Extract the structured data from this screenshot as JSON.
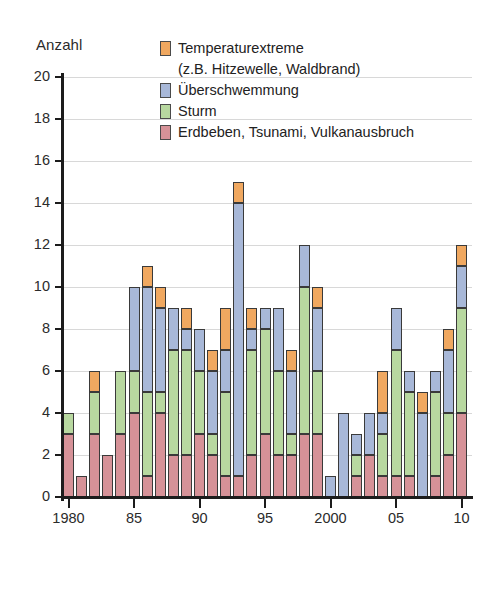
{
  "axis_title": "Anzahl",
  "legend": {
    "items": [
      {
        "label": "Temperaturextreme",
        "color": "#f0a860",
        "swatch": true
      },
      {
        "label": "(z.B. Hitzewelle, Waldbrand)",
        "color": "",
        "swatch": false
      },
      {
        "label": "Überschwemmung",
        "color": "#a8b8d8",
        "swatch": true
      },
      {
        "label": "Sturm",
        "color": "#b8d8a0",
        "swatch": true
      },
      {
        "label": "Erdbeben, Tsunami, Vulkanausbruch",
        "color": "#d69298",
        "swatch": true
      }
    ]
  },
  "caption": {
    "badge": "M 5",
    "text": "Große Naturkatastrophen",
    "accent_color": "#67c4cd"
  },
  "chart_data": {
    "type": "bar",
    "subtype": "stacked",
    "title": "Große Naturkatastrophen",
    "xlabel": "",
    "ylabel": "Anzahl",
    "ylim": [
      0,
      20
    ],
    "ytick_step": 2,
    "yticks": [
      0,
      2,
      4,
      6,
      8,
      10,
      12,
      14,
      16,
      18,
      20
    ],
    "grid": true,
    "grid_axis": "y",
    "legend_position": "top-right",
    "x": [
      1980,
      1981,
      1982,
      1983,
      1984,
      1985,
      1986,
      1987,
      1988,
      1989,
      1990,
      1991,
      1992,
      1993,
      1994,
      1995,
      1996,
      1997,
      1998,
      1999,
      2000,
      2001,
      2002,
      2003,
      2004,
      2005,
      2006,
      2007,
      2008,
      2009,
      2010
    ],
    "xtick_labels": [
      "1980",
      "85",
      "90",
      "95",
      "2000",
      "05",
      "10"
    ],
    "xtick_values": [
      1980,
      1985,
      1990,
      1995,
      2000,
      2005,
      2010
    ],
    "series": [
      {
        "name": "Erdbeben, Tsunami, Vulkanausbruch",
        "color": "#d69298",
        "values": [
          3,
          1,
          3,
          2,
          3,
          4,
          1,
          4,
          2,
          2,
          3,
          2,
          1,
          1,
          2,
          3,
          2,
          2,
          3,
          3,
          0,
          0,
          1,
          2,
          1,
          1,
          1,
          0,
          1,
          2,
          4
        ]
      },
      {
        "name": "Sturm",
        "color": "#b8d8a0",
        "values": [
          1,
          0,
          2,
          0,
          3,
          2,
          4,
          1,
          5,
          5,
          3,
          1,
          4,
          0,
          5,
          5,
          4,
          1,
          7,
          3,
          0,
          0,
          1,
          0,
          2,
          6,
          4,
          0,
          4,
          2,
          5
        ]
      },
      {
        "name": "Überschwemmung",
        "color": "#a8b8d8",
        "values": [
          0,
          0,
          0,
          0,
          0,
          4,
          5,
          4,
          2,
          1,
          2,
          3,
          2,
          13,
          1,
          1,
          3,
          3,
          2,
          3,
          1,
          4,
          1,
          2,
          1,
          2,
          1,
          4,
          1,
          3,
          2
        ]
      },
      {
        "name": "Temperaturextreme",
        "color": "#f0a860",
        "values": [
          0,
          0,
          1,
          0,
          0,
          0,
          1,
          1,
          0,
          1,
          0,
          1,
          2,
          1,
          1,
          0,
          0,
          1,
          0,
          1,
          0,
          0,
          0,
          0,
          2,
          0,
          0,
          1,
          0,
          1,
          1
        ]
      }
    ]
  }
}
